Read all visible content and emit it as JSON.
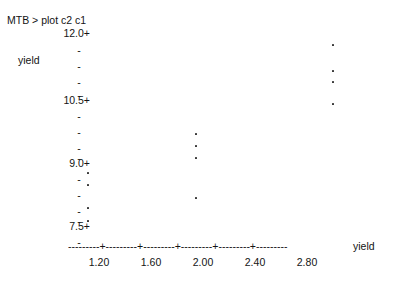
{
  "terminal": {
    "prompt_line": "MTB > plot c2 c1"
  },
  "axes": {
    "y_caption": "yield",
    "x_caption": "yield",
    "y_tick_major_glyph": "+",
    "y_tick_minor_glyph": "-",
    "x_axis_line": "---------+---------+---------+---------+---------+---------",
    "y_labels": [
      "12.0+",
      "10.5+",
      "9.0+",
      "7.5+"
    ],
    "x_labels": [
      "1.20",
      "1.60",
      "2.00",
      "2.40",
      "2.80"
    ]
  },
  "chart_data": {
    "type": "scatter",
    "title": "",
    "subtitle": "",
    "xlabel": "yield",
    "ylabel": "yield",
    "xlim": [
      0.96,
      3.16
    ],
    "ylim": [
      7.2,
      12.15
    ],
    "grid": false,
    "legend": null,
    "x_ticks": [
      1.2,
      1.6,
      2.0,
      2.4,
      2.8
    ],
    "y_ticks": [
      7.5,
      9.0,
      10.5,
      12.0
    ],
    "y_minor_tick_count_between_majors": 4,
    "series": [
      {
        "name": "c2 vs c1",
        "points": [
          {
            "x": 1.12,
            "y": 9.05
          },
          {
            "x": 1.12,
            "y": 8.77
          },
          {
            "x": 1.12,
            "y": 8.23
          },
          {
            "x": 1.12,
            "y": 7.93
          },
          {
            "x": 1.95,
            "y": 10.14
          },
          {
            "x": 1.95,
            "y": 9.86
          },
          {
            "x": 1.95,
            "y": 9.58
          },
          {
            "x": 1.95,
            "y": 8.65
          },
          {
            "x": 3.01,
            "y": 11.77
          },
          {
            "x": 3.01,
            "y": 11.16
          },
          {
            "x": 3.01,
            "y": 10.91
          },
          {
            "x": 3.01,
            "y": 10.4
          }
        ]
      }
    ]
  },
  "geometry": {
    "y_rows": [
      {
        "label": "12.0+",
        "tick": "",
        "top": 27
      },
      {
        "label": "",
        "tick": "-",
        "top": 44
      },
      {
        "label": "",
        "tick": "-",
        "top": 60
      },
      {
        "label": "",
        "tick": "-",
        "top": 76
      },
      {
        "label": "",
        "tick": "-",
        "top": 89
      },
      {
        "label": "10.5+",
        "tick": "",
        "top": 94
      },
      {
        "label": "",
        "tick": "-",
        "top": 110
      },
      {
        "label": "",
        "tick": "-",
        "top": 126
      },
      {
        "label": "",
        "tick": "-",
        "top": 142
      },
      {
        "label": "",
        "tick": "-",
        "top": 152
      },
      {
        "label": "9.0+",
        "tick": "",
        "top": 157
      },
      {
        "label": "",
        "tick": "-",
        "top": 173
      },
      {
        "label": "",
        "tick": "-",
        "top": 189
      },
      {
        "label": "",
        "tick": "-",
        "top": 205
      },
      {
        "label": "",
        "tick": "-",
        "top": 215
      },
      {
        "label": "7.5+",
        "tick": "",
        "top": 220
      },
      {
        "label": "",
        "tick": "-",
        "top": 236
      }
    ],
    "x_tick_positions": [
      99,
      151,
      203,
      255,
      307
    ],
    "points_px": [
      {
        "left": 87,
        "top": 172
      },
      {
        "left": 87,
        "top": 184
      },
      {
        "left": 87,
        "top": 207
      },
      {
        "left": 87,
        "top": 220
      },
      {
        "left": 195,
        "top": 133
      },
      {
        "left": 195,
        "top": 145
      },
      {
        "left": 195,
        "top": 157
      },
      {
        "left": 195,
        "top": 197
      },
      {
        "left": 332,
        "top": 44
      },
      {
        "left": 332,
        "top": 70
      },
      {
        "left": 332,
        "top": 81
      },
      {
        "left": 332,
        "top": 103
      }
    ]
  }
}
